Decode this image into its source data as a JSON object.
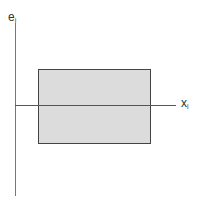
{
  "diagram": {
    "y_axis_label": {
      "base": "e",
      "sub": "i"
    },
    "x_axis_label": {
      "base": "x",
      "sub": "i"
    },
    "rectangle": {
      "fill": "#dcdcdc",
      "stroke": "#444444"
    },
    "axis_color": "#555555"
  }
}
